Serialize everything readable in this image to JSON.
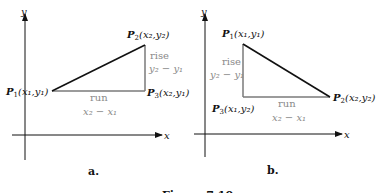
{
  "figure": {
    "caption": "Figure 7.10",
    "panels": [
      {
        "id": "a",
        "label": "a.",
        "axes": {
          "x": "x",
          "y": "y"
        },
        "points": {
          "p1": {
            "name": "P",
            "sub": "1",
            "coords": "(x₁,y₁)"
          },
          "p2": {
            "name": "P",
            "sub": "2",
            "coords": "(x₂,y₂)"
          },
          "p3": {
            "name": "P",
            "sub": "3",
            "coords": "(x₂,y₁)"
          }
        },
        "rise": {
          "label": "rise",
          "expr": "y₂ − y₁"
        },
        "run": {
          "label": "run",
          "expr": "x₂ − x₁"
        }
      },
      {
        "id": "b",
        "label": "b.",
        "axes": {
          "x": "x",
          "y": "y"
        },
        "points": {
          "p1": {
            "name": "P",
            "sub": "1",
            "coords": "(x₁,y₁)"
          },
          "p2": {
            "name": "P",
            "sub": "2",
            "coords": "(x₂,y₂)"
          },
          "p3": {
            "name": "P",
            "sub": "3",
            "coords": "(x₁,y₂)"
          }
        },
        "rise": {
          "label": "rise",
          "expr": "y₂ − y₁"
        },
        "run": {
          "label": "run",
          "expr": "x₂ − x₁"
        }
      }
    ]
  },
  "colors": {
    "ink": "#111111",
    "gray_line": "#7a7a7a",
    "gray_text": "#8a8a8a"
  }
}
